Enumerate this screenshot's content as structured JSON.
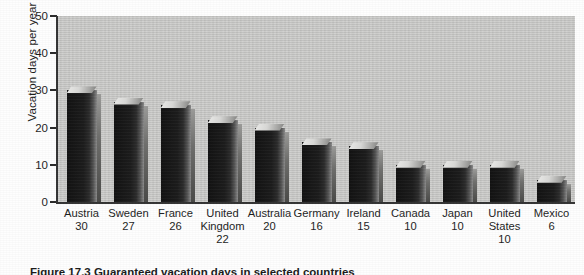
{
  "figure": {
    "caption": "Figure 17.3  Guaranteed vacation days in selected countries",
    "background_color": "#c9c9c7",
    "bar_color": "#1a1a1a",
    "axis_color": "#333333"
  },
  "chart_data": {
    "type": "bar",
    "title": "",
    "subtitle": "",
    "xlabel": "",
    "ylabel": "Vacation days per year",
    "ylim": [
      0,
      50
    ],
    "yticks": [
      0,
      10,
      20,
      30,
      40,
      50
    ],
    "grid": false,
    "legend": null,
    "style": "3d-bars",
    "categories": [
      "Austria",
      "Sweden",
      "France",
      "United Kingdom",
      "Australia",
      "Germany",
      "Ireland",
      "Canada",
      "Japan",
      "United States",
      "Mexico"
    ],
    "values": [
      30,
      27,
      26,
      22,
      20,
      16,
      15,
      10,
      10,
      10,
      6
    ],
    "tick_label_lines": [
      [
        "Austria",
        "30"
      ],
      [
        "Sweden",
        "27"
      ],
      [
        "France",
        "26"
      ],
      [
        "United Kingdom",
        "22"
      ],
      [
        "Australia",
        "20"
      ],
      [
        "Germany",
        "16"
      ],
      [
        "Ireland",
        "15"
      ],
      [
        "Canada",
        "10"
      ],
      [
        "Japan",
        "10"
      ],
      [
        "United States",
        "10"
      ],
      [
        "Mexico",
        "6"
      ]
    ]
  }
}
